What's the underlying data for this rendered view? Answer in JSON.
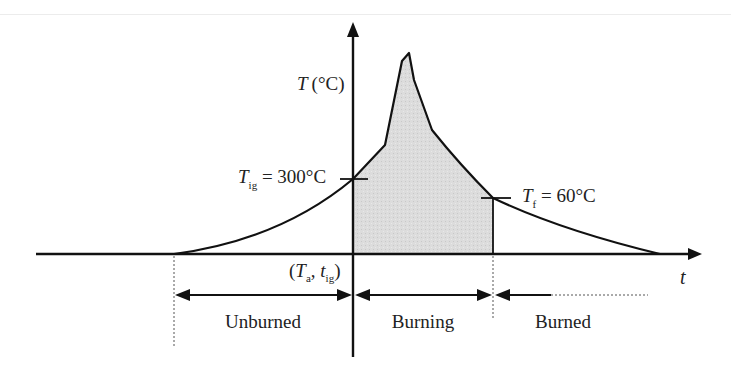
{
  "diagram": {
    "axes": {
      "y_label_var": "T",
      "y_label_unit": "(°C)",
      "x_label": "t",
      "origin_label_open": "(",
      "origin_T": "T",
      "origin_T_sub": "a",
      "origin_sep": ", ",
      "origin_t": "t",
      "origin_t_sub": "ig",
      "origin_label_close": ")"
    },
    "annotations": {
      "ignition": {
        "var": "T",
        "sub": "ig",
        "value": " = 300°C"
      },
      "final": {
        "var": "T",
        "sub": "f",
        "value": " = 60°C"
      }
    },
    "regions": [
      {
        "label": "Unburned"
      },
      {
        "label": "Burning"
      },
      {
        "label": "Burned"
      }
    ],
    "colors": {
      "line": "#111111",
      "fill": "#d9d9d9"
    }
  }
}
